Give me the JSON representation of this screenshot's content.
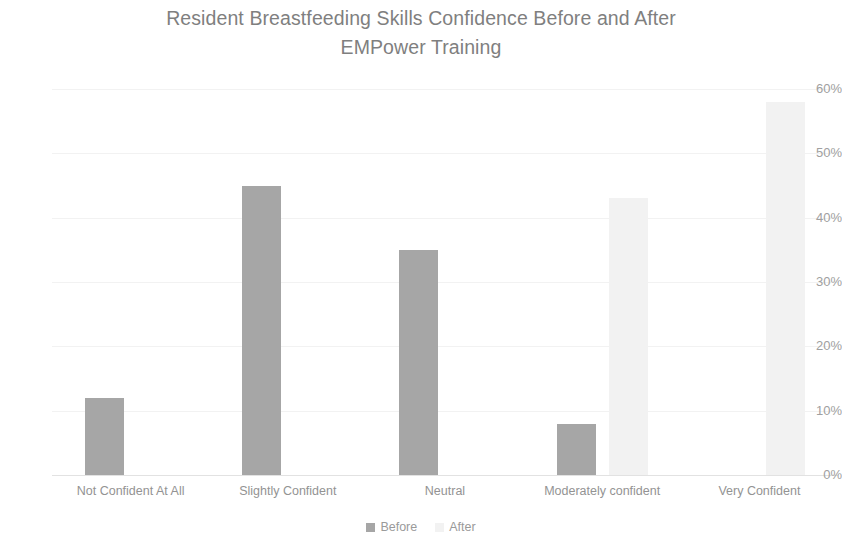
{
  "chart_data": {
    "type": "bar",
    "title": "Resident Breastfeeding Skills Confidence Before and After EMPower Training",
    "title_line1": "Resident Breastfeeding Skills Confidence Before and After",
    "title_line2": "EMPower Training",
    "xlabel": "",
    "ylabel": "",
    "categories": [
      "Not Confident At All",
      "Slightly Confident",
      "Neutral",
      "Moderately confident",
      "Very Confident"
    ],
    "series": [
      {
        "name": "Before",
        "color": "#a6a6a6",
        "values": [
          12,
          45,
          35,
          8,
          0
        ]
      },
      {
        "name": "After",
        "color": "#f2f2f2",
        "values": [
          0,
          0,
          0,
          43,
          58
        ]
      }
    ],
    "ylim": [
      0,
      60
    ],
    "ytick_labels": [
      "60%",
      "50%",
      "40%",
      "30%",
      "20%",
      "10%",
      "0%"
    ],
    "ytick_values": [
      60,
      50,
      40,
      30,
      20,
      10,
      0
    ],
    "grid": true,
    "legend_position": "bottom-center",
    "value_format": "percent"
  },
  "legend": {
    "items": [
      {
        "label": "Before",
        "color": "#a6a6a6"
      },
      {
        "label": "After",
        "color": "#f2f2f2"
      }
    ]
  }
}
